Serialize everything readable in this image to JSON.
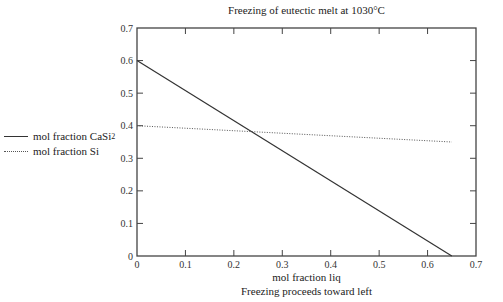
{
  "chart_data": {
    "type": "line",
    "title": "Freezing of eutectic melt at 1030°C",
    "xlabel": "mol fraction liq",
    "xlabel_sub": "Freezing proceeds toward left",
    "ylabel": "",
    "xlim": [
      0,
      0.7
    ],
    "ylim": [
      0,
      0.7
    ],
    "x_ticks": [
      "0",
      "0.1",
      "0.2",
      "0.3",
      "0.4",
      "0.5",
      "0.6",
      "0.7"
    ],
    "y_ticks": [
      "0",
      "0.1",
      "0.2",
      "0.3",
      "0.4",
      "0.5",
      "0.6",
      "0.7"
    ],
    "grid": false,
    "legend_position": "left-outside",
    "series": [
      {
        "name": "mol fraction CaSi2",
        "style": "solid",
        "color": "#333333",
        "x": [
          0,
          0.65
        ],
        "y": [
          0.6,
          0.0
        ]
      },
      {
        "name": "mol fraction Si",
        "style": "dotted",
        "color": "#555555",
        "x": [
          0,
          0.65
        ],
        "y": [
          0.4,
          0.35
        ]
      }
    ]
  },
  "legend": {
    "items": [
      {
        "label_main": "mol fraction CaSi",
        "label_sub": "2",
        "style": "solid"
      },
      {
        "label_main": "mol fraction Si",
        "label_sub": "",
        "style": "dotted"
      }
    ]
  }
}
